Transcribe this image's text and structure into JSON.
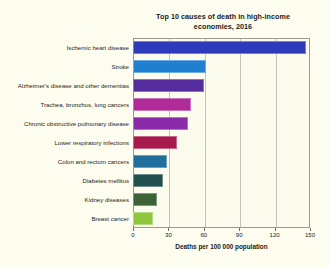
{
  "chart_data": {
    "type": "bar",
    "orientation": "horizontal",
    "title": "Top 10 causes of death in high-income economies, 2016",
    "title_line1": "Top 10 causes of death in high-income",
    "title_line2": "economies, 2016",
    "xlabel": "Deaths per 100 000 population",
    "ylabel": "",
    "xlim": [
      0,
      150
    ],
    "ylim": null,
    "grid": true,
    "grid_axis": "x",
    "legend": false,
    "xticks": [
      0,
      30,
      60,
      90,
      120,
      150
    ],
    "xtick_labels": [
      "0",
      "30",
      "60",
      "90",
      "120",
      "150"
    ],
    "categories": [
      "Ischemic heart disease",
      "Stroke",
      "Alzheimer's disease and other dementias",
      "Trachea, bronchus, lung cancers",
      "Chronic obstructive pulmonary disease",
      "Lower respiratory infections",
      "Colon and rectum cancers",
      "Diabetes mellitus",
      "Kidney diseases",
      "Breast cancer"
    ],
    "values": [
      147,
      62,
      60,
      49,
      47,
      37,
      29,
      25,
      20,
      17
    ],
    "bar_colors": [
      "#2e3bbb",
      "#1f7fd0",
      "#542c9e",
      "#b02b9a",
      "#8b2aa8",
      "#a81a4e",
      "#1f6e9c",
      "#22504e",
      "#3d6235",
      "#8ec63f"
    ],
    "background_color": "#fcfcef",
    "plot_background_color": "#fbfbee"
  }
}
